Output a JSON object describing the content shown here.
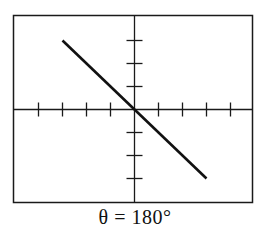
{
  "figure": {
    "caption": "θ = 180°",
    "type": "oscilloscope-lissajous",
    "colors": {
      "trace": "#111111",
      "frame": "#1a1a1a",
      "background": "#ffffff"
    }
  },
  "chart_data": {
    "type": "line",
    "title": "θ = 180°",
    "xlabel": "",
    "ylabel": "",
    "grid": false,
    "axes": "centered crosshair with tick marks",
    "x_ticks_each_side": 4,
    "y_ticks_each_side": 3,
    "xlim": [
      -5,
      5
    ],
    "ylim": [
      -4,
      4
    ],
    "series": [
      {
        "name": "trace",
        "x": [
          -3,
          3
        ],
        "y": [
          3,
          -3
        ]
      }
    ],
    "annotations": [
      "θ = 180°"
    ]
  }
}
